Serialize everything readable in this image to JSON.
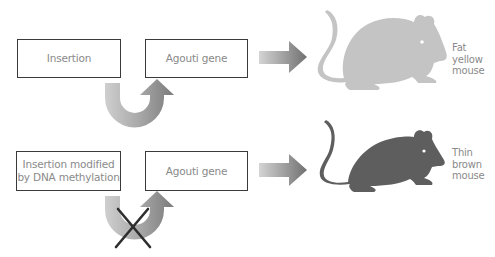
{
  "diagram": {
    "rows": [
      {
        "left_box": {
          "lines": [
            "Insertion"
          ]
        },
        "right_box": {
          "label": "Agouti gene"
        },
        "activation_arrow": "active",
        "result": {
          "lines": [
            "Fat",
            "yellow",
            "mouse"
          ],
          "mouse_color": "#c4c4c4"
        }
      },
      {
        "left_box": {
          "lines": [
            "Insertion modified",
            "by DNA methylation"
          ]
        },
        "right_box": {
          "label": "Agouti gene"
        },
        "activation_arrow": "blocked",
        "result": {
          "lines": [
            "Thin",
            "brown",
            "mouse"
          ],
          "mouse_color": "#5e5e5e"
        }
      }
    ],
    "colors": {
      "box_border": "#3a3a3a",
      "text": "#8a8a8a",
      "arrow_light": "#d2d2d2",
      "arrow_dark": "#7a7a7a",
      "cross": "#2e2e2e"
    }
  }
}
